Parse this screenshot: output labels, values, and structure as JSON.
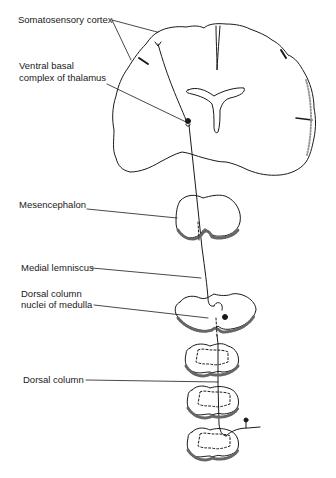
{
  "diagram": {
    "labels": {
      "somatosensory_cortex": "Somatosensory cortex",
      "ventral_basal_line1": "Ventral basal",
      "ventral_basal_line2": "complex of thalamus",
      "mesencephalon": "Mesencephalon",
      "medial_lemniscus": "Medial lemniscus",
      "dorsal_column_nuclei_line1": "Dorsal column",
      "dorsal_column_nuclei_line2": "nuclei of medulla",
      "dorsal_column": "Dorsal column"
    },
    "structures": [
      "cerebrum-coronal-section",
      "mesencephalon-section",
      "medulla-section",
      "spinal-cord-section-1",
      "spinal-cord-section-2",
      "spinal-cord-section-3"
    ],
    "colors": {
      "line": "#1a1a1a",
      "background": "#ffffff"
    }
  }
}
